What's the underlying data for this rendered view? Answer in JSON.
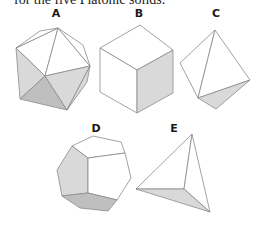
{
  "caption": "for the five Platonic solids.",
  "figure": {
    "panels": [
      {
        "label": "A",
        "solid": "icosahedron"
      },
      {
        "label": "B",
        "solid": "cube"
      },
      {
        "label": "C",
        "solid": "octahedron"
      },
      {
        "label": "D",
        "solid": "dodecahedron"
      },
      {
        "label": "E",
        "solid": "tetrahedron"
      }
    ],
    "colors": {
      "light_face": "#ffffff",
      "mid_face": "#d9d9d9",
      "dark_face": "#bfbfbf",
      "edge": "#8a8a8a"
    }
  }
}
